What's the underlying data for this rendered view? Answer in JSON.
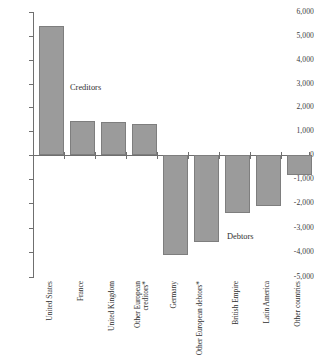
{
  "chart_data": {
    "type": "bar",
    "title": "",
    "subtitle": "",
    "xlabel": "",
    "ylabel": "",
    "ylim": [
      -5000,
      6000
    ],
    "grid": false,
    "legend": "none",
    "orientation": "vertical",
    "bar_color": "#9b9b9b",
    "bar_edge_color": "#7e7e7e",
    "axis_color": "#6f6f6f",
    "categories": [
      "United States",
      "France",
      "United Kingdom",
      "Other European creditors*",
      "Germany",
      "Other European debtors*",
      "British Empire",
      "Latin America",
      "Other countries"
    ],
    "values": [
      5300,
      1380,
      1370,
      1270,
      -4100,
      -3550,
      -2370,
      -2100,
      -800
    ],
    "ytick_labels": [
      "6,000",
      "5,000",
      "4,000",
      "3,000",
      "2,000",
      "1,000",
      "0",
      "-1,000",
      "-2,000",
      "-3,000",
      "-4,000",
      "-5,000"
    ],
    "ytick_values": [
      6000,
      5000,
      4000,
      3000,
      2000,
      1000,
      0,
      -1000,
      -2000,
      -3000,
      -4000,
      -5000
    ],
    "annotations": [
      {
        "text": "Creditors",
        "category_hint": "positive-bars"
      },
      {
        "text": "Debtors",
        "category_hint": "negative-bars"
      }
    ]
  },
  "axis": {
    "ytick_0": "6,000",
    "ytick_1": "5,000",
    "ytick_2": "4,000",
    "ytick_3": "3,000",
    "ytick_4": "2,000",
    "ytick_5": "1,000",
    "ytick_6": "0",
    "ytick_7": "-1,000",
    "ytick_8": "-2,000",
    "ytick_9": "-3,000",
    "ytick_10": "-4,000",
    "ytick_11": "-5,000"
  },
  "labels": {
    "cat_0": "United States",
    "cat_1": "France",
    "cat_2": "United Kingdom",
    "cat_3": "Other European creditors*",
    "cat_4": "Germany",
    "cat_5": "Other European debtors*",
    "cat_6": "British Empire",
    "cat_7": "Latin America",
    "cat_8": "Other countries"
  },
  "annotations": {
    "creditors": "Creditors",
    "debtors": "Debtors"
  }
}
